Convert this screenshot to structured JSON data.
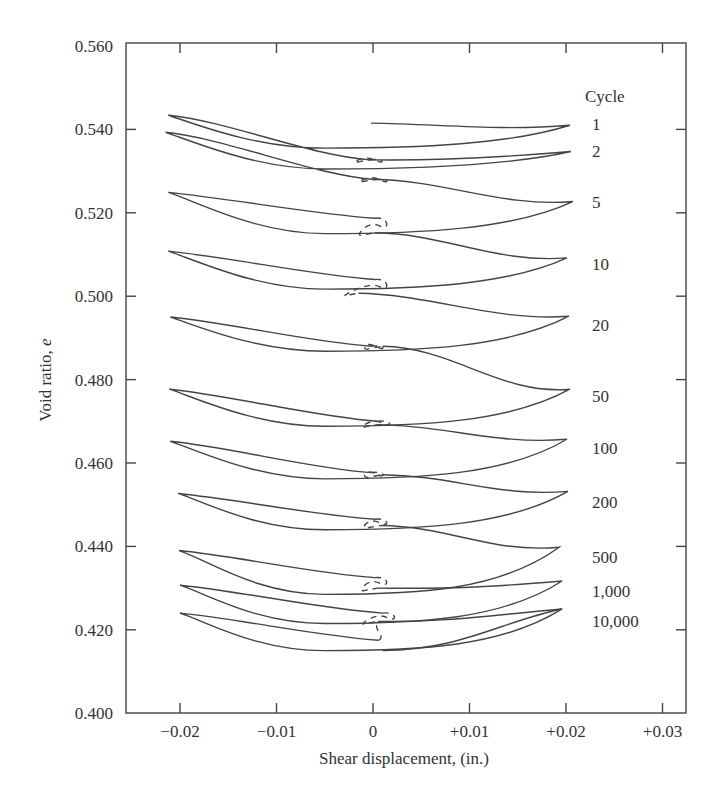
{
  "chart_data": {
    "type": "line",
    "title": "",
    "xlabel": "Shear displacement, (in.)",
    "ylabel": "Void ratio, e",
    "xlim": [
      -0.025,
      0.033
    ],
    "ylim": [
      0.4,
      0.56
    ],
    "x_ticks": [
      -0.02,
      -0.01,
      0,
      0.01,
      0.02,
      0.03
    ],
    "x_tick_labels": [
      "−0.02",
      "−0.01",
      "0",
      "+0.01",
      "+0.02",
      "+0.03"
    ],
    "y_ticks": [
      0.4,
      0.42,
      0.44,
      0.46,
      0.48,
      0.5,
      0.52,
      0.54,
      0.56
    ],
    "y_tick_labels": [
      "0.400",
      "0.420",
      "0.440",
      "0.460",
      "0.480",
      "0.500",
      "0.520",
      "0.540",
      "0.560"
    ],
    "grid": false,
    "legend_title": "Cycle",
    "legend_position": "right, labels beside each loop",
    "series": [
      {
        "name": "1",
        "start": [
          -0.0002,
          0.5415
        ],
        "left_tip": [
          -0.0212,
          0.5434
        ],
        "right_tip": [
          0.0204,
          0.541
        ],
        "end": [
          -0.0003,
          0.5327
        ],
        "lower_min": 0.5355,
        "label_y": 0.5412
      },
      {
        "name": "2",
        "start": [
          -0.0003,
          0.5327
        ],
        "left_tip": [
          -0.0215,
          0.5393
        ],
        "right_tip": [
          0.0205,
          0.5347
        ],
        "end": [
          0.0002,
          0.528
        ],
        "lower_min": 0.5305,
        "label_y": 0.5348
      },
      {
        "name": "5",
        "start": [
          0.0002,
          0.528
        ],
        "left_tip": [
          -0.0212,
          0.5249
        ],
        "right_tip": [
          0.0207,
          0.5227
        ],
        "end": [
          0.0002,
          0.5187
        ],
        "lower_min": 0.515,
        "label_y": 0.5225
      },
      {
        "name": "10",
        "start": [
          0.0002,
          0.5152
        ],
        "left_tip": [
          -0.0212,
          0.5108
        ],
        "right_tip": [
          0.0201,
          0.5092
        ],
        "end": [
          0.0002,
          0.504
        ],
        "lower_min": 0.5017,
        "label_y": 0.5077
      },
      {
        "name": "20",
        "start": [
          -0.0015,
          0.5007
        ],
        "left_tip": [
          -0.021,
          0.495
        ],
        "right_tip": [
          0.0203,
          0.4952
        ],
        "end": [
          -0.0002,
          0.488
        ],
        "lower_min": 0.4868,
        "label_y": 0.493
      },
      {
        "name": "50",
        "start": [
          0.001,
          0.488
        ],
        "left_tip": [
          -0.0211,
          0.4777
        ],
        "right_tip": [
          0.0204,
          0.4777
        ],
        "end": [
          0.0005,
          0.47
        ],
        "lower_min": 0.4688,
        "label_y": 0.476
      },
      {
        "name": "100",
        "start": [
          0.0005,
          0.4692
        ],
        "left_tip": [
          -0.021,
          0.4652
        ],
        "right_tip": [
          0.0201,
          0.4657
        ],
        "end": [
          -0.0002,
          0.4577
        ],
        "lower_min": 0.4562,
        "label_y": 0.4637
      },
      {
        "name": "200",
        "start": [
          0.001,
          0.4572
        ],
        "left_tip": [
          -0.0202,
          0.4527
        ],
        "right_tip": [
          0.0202,
          0.4532
        ],
        "end": [
          0.0002,
          0.4465
        ],
        "lower_min": 0.444,
        "label_y": 0.4507
      },
      {
        "name": "500",
        "start": [
          0.0008,
          0.445
        ],
        "left_tip": [
          -0.0201,
          0.439
        ],
        "right_tip": [
          0.0193,
          0.4398
        ],
        "end": [
          0.0002,
          0.4325
        ],
        "lower_min": 0.4285,
        "label_y": 0.4375
      },
      {
        "name": "1,000",
        "start": [
          0.0005,
          0.43
        ],
        "left_tip": [
          -0.02,
          0.4307
        ],
        "right_tip": [
          0.0196,
          0.4317
        ],
        "end": [
          0.001,
          0.424
        ],
        "lower_min": 0.4215,
        "label_y": 0.4292
      },
      {
        "name": "10,000",
        "start": [
          0.0005,
          0.422
        ],
        "left_tip": [
          -0.02,
          0.424
        ],
        "right_tip": [
          0.0196,
          0.425
        ],
        "end": [
          0.0006,
          0.4175
        ],
        "lower_min": 0.415,
        "label_y": 0.422,
        "final_end": [
          0.001,
          0.415
        ]
      }
    ],
    "annotation": "Dashed line connects successive cycles near zero displacement"
  },
  "plot_area": {
    "left": 126,
    "right": 686,
    "top": 43,
    "bottom": 713
  }
}
